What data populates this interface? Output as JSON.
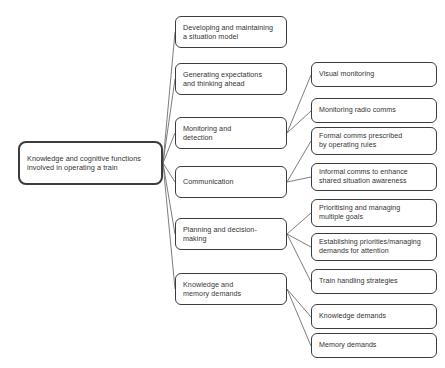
{
  "diagram": {
    "type": "tree",
    "orientation": "left-to-right",
    "root": {
      "id": "root",
      "label": "Knowledge and cognitive functions\ninvolved in operating a train",
      "x": 18,
      "y": 141,
      "width": 145,
      "height": 44
    },
    "branches": [
      {
        "id": "developing-situation-model",
        "label": "Developing and maintaining\na situation model",
        "x": 175,
        "y": 16,
        "width": 112,
        "height": 32,
        "children": []
      },
      {
        "id": "generating-expectations",
        "label": "Generating expectations\nand thinking ahead",
        "x": 175,
        "y": 63,
        "width": 112,
        "height": 32,
        "children": []
      },
      {
        "id": "monitoring-detection",
        "label": "Monitoring and\ndetection",
        "x": 175,
        "y": 117,
        "width": 112,
        "height": 32,
        "children": [
          "visual-monitoring",
          "monitoring-radio-comms"
        ]
      },
      {
        "id": "communication",
        "label": "Communication",
        "x": 175,
        "y": 166,
        "width": 112,
        "height": 32,
        "children": [
          "formal-comms",
          "informal-comms"
        ]
      },
      {
        "id": "planning-decision-making",
        "label": "Planning and decision-\nmaking",
        "x": 175,
        "y": 218,
        "width": 112,
        "height": 32,
        "children": [
          "prioritising-managing-goals",
          "establishing-priorities",
          "train-handling-strategies"
        ]
      },
      {
        "id": "knowledge-memory-demands",
        "label": "Knowledge and\nmemory demands",
        "x": 175,
        "y": 273,
        "width": 112,
        "height": 32,
        "children": [
          "knowledge-demands",
          "memory-demands"
        ]
      }
    ],
    "leaves": [
      {
        "id": "visual-monitoring",
        "label": "Visual monitoring",
        "x": 311,
        "y": 62,
        "width": 126,
        "height": 25
      },
      {
        "id": "monitoring-radio-comms",
        "label": "Monitoring radio comms",
        "x": 311,
        "y": 98,
        "width": 126,
        "height": 25
      },
      {
        "id": "formal-comms",
        "label": "Formal comms prescribed\nby operating rules",
        "x": 311,
        "y": 127,
        "width": 126,
        "height": 28
      },
      {
        "id": "informal-comms",
        "label": "Informal comms to enhance\nshared situation awareness",
        "x": 311,
        "y": 163,
        "width": 126,
        "height": 28
      },
      {
        "id": "prioritising-managing-goals",
        "label": "Prioritising and managing\nmultiple goals",
        "x": 311,
        "y": 199,
        "width": 126,
        "height": 28
      },
      {
        "id": "establishing-priorities",
        "label": "Establishing priorities/managing\ndemands for attention",
        "x": 311,
        "y": 233,
        "width": 126,
        "height": 28
      },
      {
        "id": "train-handling-strategies",
        "label": "Train handling strategies",
        "x": 311,
        "y": 269,
        "width": 126,
        "height": 25
      },
      {
        "id": "knowledge-demands",
        "label": "Knowledge demands",
        "x": 311,
        "y": 304,
        "width": 126,
        "height": 25
      },
      {
        "id": "memory-demands",
        "label": "Memory demands",
        "x": 311,
        "y": 333,
        "width": 126,
        "height": 25
      }
    ],
    "connectors": [
      {
        "from": "root",
        "to": "developing-situation-model",
        "x1": 163,
        "y1": 163,
        "x2": 175,
        "y2": 32
      },
      {
        "from": "root",
        "to": "generating-expectations",
        "x1": 163,
        "y1": 163,
        "x2": 175,
        "y2": 79
      },
      {
        "from": "root",
        "to": "monitoring-detection",
        "x1": 163,
        "y1": 163,
        "x2": 175,
        "y2": 133
      },
      {
        "from": "root",
        "to": "communication",
        "x1": 163,
        "y1": 163,
        "x2": 175,
        "y2": 182
      },
      {
        "from": "root",
        "to": "planning-decision-making",
        "x1": 163,
        "y1": 163,
        "x2": 175,
        "y2": 234
      },
      {
        "from": "root",
        "to": "knowledge-memory-demands",
        "x1": 163,
        "y1": 163,
        "x2": 175,
        "y2": 289
      },
      {
        "from": "monitoring-detection",
        "to": "visual-monitoring",
        "x1": 287,
        "y1": 133,
        "x2": 311,
        "y2": 75
      },
      {
        "from": "monitoring-detection",
        "to": "monitoring-radio-comms",
        "x1": 287,
        "y1": 133,
        "x2": 311,
        "y2": 111
      },
      {
        "from": "communication",
        "to": "formal-comms",
        "x1": 287,
        "y1": 182,
        "x2": 311,
        "y2": 141
      },
      {
        "from": "communication",
        "to": "informal-comms",
        "x1": 287,
        "y1": 182,
        "x2": 311,
        "y2": 177
      },
      {
        "from": "planning-decision-making",
        "to": "prioritising-managing-goals",
        "x1": 287,
        "y1": 234,
        "x2": 311,
        "y2": 213
      },
      {
        "from": "planning-decision-making",
        "to": "establishing-priorities",
        "x1": 287,
        "y1": 234,
        "x2": 311,
        "y2": 247
      },
      {
        "from": "planning-decision-making",
        "to": "train-handling-strategies",
        "x1": 287,
        "y1": 234,
        "x2": 311,
        "y2": 282
      },
      {
        "from": "knowledge-memory-demands",
        "to": "knowledge-demands",
        "x1": 287,
        "y1": 289,
        "x2": 311,
        "y2": 317
      },
      {
        "from": "knowledge-memory-demands",
        "to": "memory-demands",
        "x1": 287,
        "y1": 289,
        "x2": 311,
        "y2": 346
      }
    ],
    "style": {
      "line_color": "#6e6e6e",
      "border_color": "#3c3c3c",
      "text_color": "#343434",
      "background": "#ffffff"
    }
  }
}
